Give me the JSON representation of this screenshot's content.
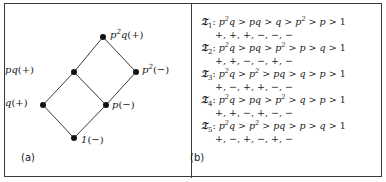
{
  "figure": {
    "panel_a": {
      "tag": "(a)",
      "diagram_type": "hasse-diagram",
      "nodes": [
        {
          "id": "p2q",
          "label_html": "p<sup>2</sup>q",
          "sign": "(+)",
          "x": 98,
          "y": 33,
          "label_x": 105,
          "label_y": 26,
          "anchor": "left"
        },
        {
          "id": "pq",
          "label_html": "pq",
          "sign": "(+)",
          "x": 69,
          "y": 68,
          "label_x": 28,
          "label_y": 61,
          "anchor": "right"
        },
        {
          "id": "p2",
          "label_html": "p<sup>2</sup>",
          "sign": "(−)",
          "x": 131,
          "y": 68,
          "label_x": 137,
          "label_y": 61,
          "anchor": "left"
        },
        {
          "id": "q",
          "label_html": "q",
          "sign": "(+)",
          "x": 38,
          "y": 101,
          "label_x": 5,
          "label_y": 94,
          "anchor": "right"
        },
        {
          "id": "p",
          "label_html": "p",
          "sign": "(−)",
          "x": 101,
          "y": 101,
          "label_x": 107,
          "label_y": 96,
          "anchor": "left"
        },
        {
          "id": "one",
          "label_html": "1",
          "sign": "(−)",
          "x": 69,
          "y": 134,
          "label_x": 76,
          "label_y": 131,
          "anchor": "left"
        }
      ],
      "edges": [
        {
          "from": "one",
          "to": "q"
        },
        {
          "from": "one",
          "to": "p"
        },
        {
          "from": "q",
          "to": "pq"
        },
        {
          "from": "p",
          "to": "pq"
        },
        {
          "from": "p",
          "to": "p2"
        },
        {
          "from": "pq",
          "to": "p2q"
        },
        {
          "from": "p2",
          "to": "p2q"
        }
      ]
    },
    "panel_b": {
      "tag": "(b)",
      "orders": [
        {
          "name": "𝔗",
          "subscript": "1",
          "chain": "p²q > pq > q > p² > p > 1",
          "chain_terms": [
            "p^2q",
            "pq",
            "q",
            "p^2",
            "p",
            "1"
          ],
          "signs": "+, +, +, −, −, −",
          "sign_list": [
            "+",
            "+",
            "+",
            "−",
            "−",
            "−"
          ]
        },
        {
          "name": "𝔗",
          "subscript": "2",
          "chain": "p²q > pq > p² > p > q > 1",
          "chain_terms": [
            "p^2q",
            "pq",
            "p^2",
            "p",
            "q",
            "1"
          ],
          "signs": "+, +, −, −, +, −",
          "sign_list": [
            "+",
            "+",
            "−",
            "−",
            "+",
            "−"
          ]
        },
        {
          "name": "𝔗",
          "subscript": "3",
          "chain": "p²q > p² > pq > q > p > 1",
          "chain_terms": [
            "p^2q",
            "p^2",
            "pq",
            "q",
            "p",
            "1"
          ],
          "signs": "+, −, +, +, −, −",
          "sign_list": [
            "+",
            "−",
            "+",
            "+",
            "−",
            "−"
          ]
        },
        {
          "name": "𝔗",
          "subscript": "4",
          "chain": "p²q > pq > p² > q > p > 1",
          "chain_terms": [
            "p^2q",
            "pq",
            "p^2",
            "q",
            "p",
            "1"
          ],
          "signs": "+, +, −, +, −, −",
          "sign_list": [
            "+",
            "+",
            "−",
            "+",
            "−",
            "−"
          ]
        },
        {
          "name": "𝔗",
          "subscript": "5",
          "chain": "p²q > p² > pq > p > q > 1",
          "chain_terms": [
            "p^2q",
            "p^2",
            "pq",
            "p",
            "q",
            "1"
          ],
          "signs": "+, −, +, −, +, −",
          "sign_list": [
            "+",
            "−",
            "+",
            "−",
            "+",
            "−"
          ]
        }
      ]
    },
    "colors": {
      "border": "#3a3a3a",
      "node": "#111111",
      "edge": "#3a3a3a",
      "text": "#1a1a1a",
      "background": "#ffffff"
    }
  }
}
